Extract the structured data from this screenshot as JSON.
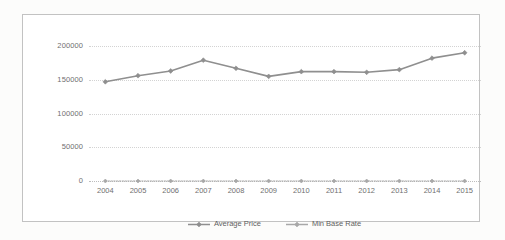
{
  "chart_data": {
    "type": "line",
    "title": "",
    "xlabel": "",
    "ylabel": "",
    "categories": [
      "2004",
      "2005",
      "2006",
      "2007",
      "2008",
      "2009",
      "2010",
      "2011",
      "2012",
      "2013",
      "2014",
      "2015"
    ],
    "series": [
      {
        "name": "Average Price",
        "color": "#8f8f8f",
        "marker": "diamond",
        "values": [
          147000,
          156000,
          163000,
          179000,
          167000,
          155000,
          162000,
          162000,
          161000,
          165000,
          182000,
          190000
        ]
      },
      {
        "name": "Min Base Rate",
        "color": "#a8a8a8",
        "marker": "diamond",
        "values": [
          0,
          0,
          0,
          0,
          0,
          0,
          0,
          0,
          0,
          0,
          0,
          0
        ]
      }
    ],
    "ylim": [
      0,
      200000
    ],
    "yticks": [
      0,
      50000,
      100000,
      150000,
      200000
    ],
    "ytick_labels": [
      "0",
      "50000",
      "100000",
      "150000",
      "200000"
    ],
    "grid": true,
    "grid_style": "dotted-horizontal",
    "legend_position": "bottom-center",
    "plot_background": "#ffffff",
    "border_color": "#c2c2c2"
  },
  "axis": {
    "y_labels": [
      "200000",
      "150000",
      "100000",
      "50000",
      "0"
    ],
    "x_labels": [
      "2004",
      "2005",
      "2006",
      "2007",
      "2008",
      "2009",
      "2010",
      "2011",
      "2012",
      "2013",
      "2014",
      "2015"
    ]
  },
  "legend": {
    "items": [
      {
        "label": "Average Price",
        "icon": "line-with-diamond-marker-icon",
        "color": "#8f8f8f"
      },
      {
        "label": "Min Base Rate",
        "icon": "line-with-diamond-marker-icon",
        "color": "#a8a8a8"
      }
    ]
  }
}
